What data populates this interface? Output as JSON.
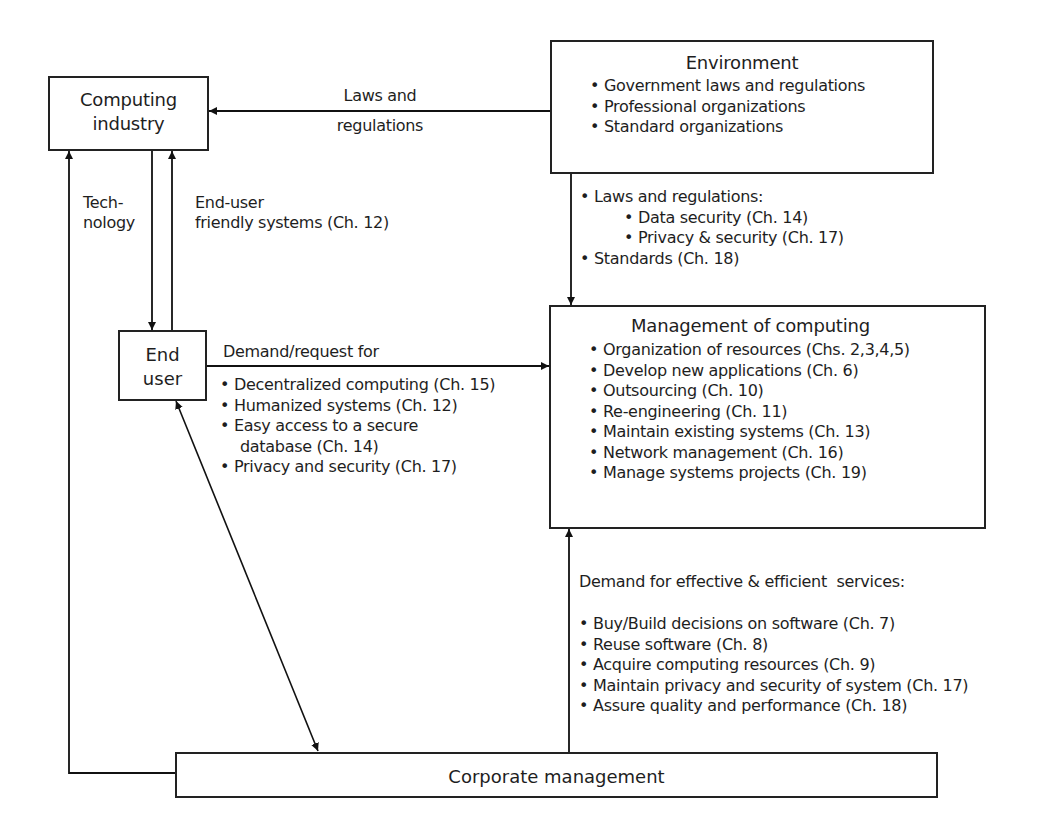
{
  "nodes": {
    "computing_industry": {
      "line1": "Computing",
      "line2": "industry"
    },
    "environment": {
      "title": "Environment",
      "items": [
        "Government laws and regulations",
        "Professional organizations",
        "Standard organizations"
      ]
    },
    "end_user": {
      "line1": "End",
      "line2": "user"
    },
    "management": {
      "title": "Management of computing",
      "items": [
        "Organization of resources (Chs. 2,3,4,5)",
        "Develop new applications (Ch. 6)",
        "Outsourcing (Ch. 10)",
        "Re-engineering (Ch. 11)",
        "Maintain existing systems (Ch. 13)",
        "Network management (Ch. 16)",
        "Manage systems projects (Ch. 19)"
      ]
    },
    "corporate": {
      "label": "Corporate management"
    }
  },
  "edges": {
    "env_to_industry": {
      "line1": "Laws and",
      "line2": "regulations"
    },
    "technology": {
      "line1": "Tech-",
      "line2": "nology"
    },
    "end_user_friendly": {
      "line1": "End-user",
      "line2": "friendly systems (Ch. 12)"
    },
    "env_to_management": {
      "heading": "Laws and regulations:",
      "sub": [
        "Data security (Ch. 14)",
        "Privacy & security (Ch. 17)"
      ],
      "tail": "Standards (Ch. 18)"
    },
    "demand_request": {
      "heading": "Demand/request for",
      "items": [
        "Decentralized computing (Ch. 15)",
        "Humanized systems (Ch. 12)",
        "Easy access to a secure",
        "database (Ch. 14)",
        "Privacy and security (Ch. 17)"
      ]
    },
    "corporate_to_management": {
      "heading": "Demand for effective & efficient  services:",
      "items": [
        "Buy/Build decisions on software (Ch. 7)",
        "Reuse software (Ch. 8)",
        "Acquire computing resources (Ch. 9)",
        "Maintain privacy and security of system (Ch. 17)",
        "Assure quality and performance (Ch. 18)"
      ]
    }
  }
}
